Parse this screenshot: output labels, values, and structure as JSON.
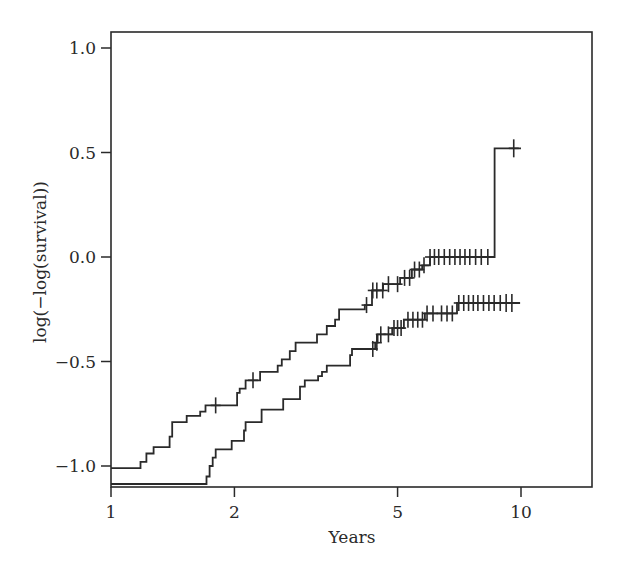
{
  "chart_data": {
    "type": "line",
    "subtype": "step (log-minus-log survival plot)",
    "title": "",
    "xlabel": "Years",
    "ylabel": "log(−log(survival))",
    "xscale": "log",
    "xlim": [
      1,
      16
    ],
    "ylim": [
      -1.09,
      1.1
    ],
    "x_ticks": [
      1,
      2,
      5,
      10
    ],
    "x_tick_labels": [
      "1",
      "2",
      "5",
      "10"
    ],
    "y_ticks": [
      1.0,
      0.5,
      0.0,
      -0.5,
      -1.0
    ],
    "y_tick_labels": [
      "1.0",
      "0.5",
      "0.0",
      "−0.5",
      "−1.0"
    ],
    "grid": false,
    "legend": null,
    "series": [
      {
        "name": "upper group",
        "steps": [
          [
            1.0,
            -1.01
          ],
          [
            1.18,
            -0.98
          ],
          [
            1.22,
            -0.94
          ],
          [
            1.27,
            -0.91
          ],
          [
            1.39,
            -0.86
          ],
          [
            1.41,
            -0.79
          ],
          [
            1.53,
            -0.76
          ],
          [
            1.65,
            -0.74
          ],
          [
            1.7,
            -0.71
          ],
          [
            2.03,
            -0.65
          ],
          [
            2.06,
            -0.63
          ],
          [
            2.13,
            -0.59
          ],
          [
            2.31,
            -0.55
          ],
          [
            2.55,
            -0.52
          ],
          [
            2.61,
            -0.49
          ],
          [
            2.73,
            -0.45
          ],
          [
            2.82,
            -0.41
          ],
          [
            3.18,
            -0.37
          ],
          [
            3.36,
            -0.33
          ],
          [
            3.52,
            -0.3
          ],
          [
            3.6,
            -0.25
          ],
          [
            4.16,
            -0.23
          ],
          [
            4.33,
            -0.16
          ],
          [
            4.61,
            -0.13
          ],
          [
            5.07,
            -0.1
          ],
          [
            5.42,
            -0.06
          ],
          [
            5.74,
            -0.04
          ],
          [
            6.0,
            0.0
          ],
          [
            8.62,
            0.52
          ]
        ],
        "end_x": 10.0,
        "censored_x": [
          1.8,
          2.22,
          4.2,
          4.35,
          4.45,
          4.6,
          4.75,
          5.0,
          5.2,
          5.35,
          5.5,
          5.65,
          5.8,
          6.0,
          6.15,
          6.3,
          6.5,
          6.7,
          6.9,
          7.1,
          7.3,
          7.5,
          7.75,
          8.0,
          8.3,
          9.6
        ]
      },
      {
        "name": "lower group",
        "steps": [
          [
            1.0,
            -1.09
          ],
          [
            1.71,
            -1.05
          ],
          [
            1.74,
            -1.0
          ],
          [
            1.77,
            -0.96
          ],
          [
            1.8,
            -0.92
          ],
          [
            1.97,
            -0.88
          ],
          [
            2.11,
            -0.83
          ],
          [
            2.13,
            -0.79
          ],
          [
            2.33,
            -0.73
          ],
          [
            2.63,
            -0.68
          ],
          [
            2.89,
            -0.62
          ],
          [
            2.97,
            -0.59
          ],
          [
            3.2,
            -0.57
          ],
          [
            3.27,
            -0.55
          ],
          [
            3.36,
            -0.52
          ],
          [
            3.83,
            -0.47
          ],
          [
            3.87,
            -0.44
          ],
          [
            4.41,
            -0.41
          ],
          [
            4.47,
            -0.37
          ],
          [
            4.85,
            -0.34
          ],
          [
            5.18,
            -0.3
          ],
          [
            5.83,
            -0.27
          ],
          [
            6.98,
            -0.22
          ]
        ],
        "end_x": 9.95,
        "censored_x": [
          4.35,
          4.45,
          4.55,
          4.75,
          4.9,
          5.0,
          5.1,
          5.3,
          5.45,
          5.6,
          5.75,
          5.9,
          6.1,
          6.4,
          6.6,
          6.8,
          7.05,
          7.25,
          7.45,
          7.65,
          7.85,
          8.1,
          8.35,
          8.6,
          8.9,
          9.2,
          9.5
        ]
      }
    ]
  }
}
